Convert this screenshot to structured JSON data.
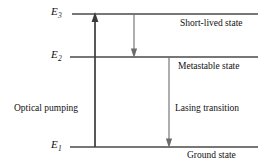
{
  "figure": {
    "kind": "energy-level-diagram",
    "background_color": "#ffffff",
    "stroke_color": "#3a3a3a",
    "text_color": "#111111"
  },
  "levels": [
    {
      "id": "e3",
      "symbol": "E",
      "subscript": "3",
      "state_label": "Short-lived state",
      "y": 14,
      "x_start": 72,
      "x_end": 258
    },
    {
      "id": "e2",
      "symbol": "E",
      "subscript": "2",
      "state_label": "Metastable state",
      "y": 57,
      "x_start": 70,
      "x_end": 258
    },
    {
      "id": "e1",
      "symbol": "E",
      "subscript": "1",
      "state_label": "Ground state",
      "y": 147,
      "x_start": 70,
      "x_end": 258
    }
  ],
  "transitions": [
    {
      "id": "optical-pumping",
      "label": "Optical pumping",
      "direction": "up",
      "x": 95,
      "from_level": "e1",
      "from_y": 147,
      "to_level": "e3",
      "to_y": 14
    },
    {
      "id": "nonradiative-decay",
      "label": "",
      "direction": "down",
      "x": 134,
      "from_level": "e3",
      "from_y": 14,
      "to_level": "e2",
      "to_y": 57
    },
    {
      "id": "lasing-transition",
      "label": "Lasing transition",
      "direction": "down",
      "x": 169,
      "from_level": "e2",
      "from_y": 57,
      "to_level": "e1",
      "to_y": 147
    }
  ]
}
